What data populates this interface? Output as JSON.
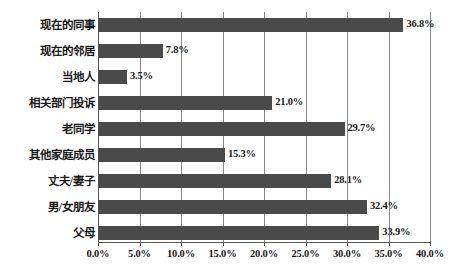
{
  "chart_data": {
    "type": "bar",
    "orientation": "horizontal",
    "title": "",
    "subtitle": "",
    "xlabel": "",
    "ylabel": "",
    "categories": [
      "现在的同事",
      "现在的邻居",
      "当地人",
      "相关部门投诉",
      "老同学",
      "其他家庭成员",
      "丈夫/妻子",
      "男/女朋友",
      "父母"
    ],
    "values": [
      36.8,
      7.8,
      3.5,
      21.0,
      29.7,
      15.3,
      28.1,
      32.4,
      33.9
    ],
    "data_labels": [
      "36.8%",
      "7.8%",
      "3.5%",
      "21.0%",
      "29.7%",
      "15.3%",
      "28.1%",
      "32.4%",
      "33.9%"
    ],
    "xlim": [
      0,
      40
    ],
    "xticks": [
      0,
      5,
      10,
      15,
      20,
      25,
      30,
      35,
      40
    ],
    "xtick_labels": [
      "0.0%",
      "5.0%",
      "10.0%",
      "15.0%",
      "20.0%",
      "25.0%",
      "30.0%",
      "35.0%",
      "40.0%"
    ],
    "grid": "vertical",
    "legend": "none",
    "bar_color": "#4a4a4a",
    "gridline_color": "#888888",
    "axis_color": "#555555",
    "text_color": "#1a1a1a",
    "background": "#ffffff"
  }
}
